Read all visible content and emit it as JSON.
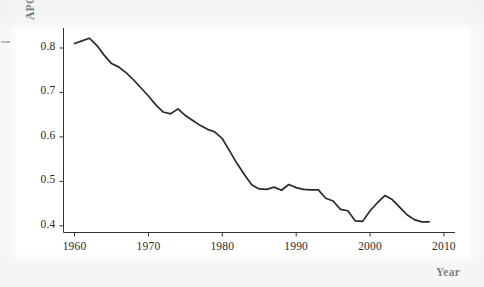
{
  "chart_data": {
    "type": "line",
    "title": "",
    "subtitle": "",
    "xlabel": "Year",
    "ylabel": "APC",
    "xlim": [
      1958.5,
      2011.5
    ],
    "ylim": [
      0.385,
      0.845
    ],
    "grid": false,
    "legend": null,
    "xticks": [
      1960,
      1970,
      1980,
      1990,
      2000,
      2010
    ],
    "xtick_labels": [
      "1960",
      "1970",
      "1980",
      "1990",
      "2000",
      "2010"
    ],
    "yticks": [
      0.4,
      0.5,
      0.6,
      0.7,
      0.8
    ],
    "ytick_labels": [
      "0.4",
      "0.5",
      "0.6",
      "0.7",
      "0.8"
    ],
    "series": [
      {
        "name": "APC",
        "color": "#2a2a2a",
        "x": [
          1960,
          1961,
          1962,
          1963,
          1964,
          1965,
          1966,
          1967,
          1968,
          1969,
          1970,
          1971,
          1972,
          1973,
          1974,
          1975,
          1976,
          1977,
          1978,
          1979,
          1980,
          1981,
          1982,
          1983,
          1984,
          1985,
          1986,
          1987,
          1988,
          1989,
          1990,
          1991,
          1992,
          1993,
          1994,
          1995,
          1996,
          1997,
          1998,
          1999,
          2000,
          2001,
          2002,
          2003,
          2004,
          2005,
          2006,
          2007,
          2008
        ],
        "values": [
          0.81,
          0.816,
          0.822,
          0.806,
          0.784,
          0.765,
          0.757,
          0.744,
          0.728,
          0.71,
          0.692,
          0.672,
          0.656,
          0.652,
          0.663,
          0.648,
          0.637,
          0.626,
          0.617,
          0.611,
          0.596,
          0.568,
          0.54,
          0.515,
          0.492,
          0.483,
          0.482,
          0.487,
          0.48,
          0.493,
          0.486,
          0.482,
          0.481,
          0.481,
          0.462,
          0.456,
          0.437,
          0.434,
          0.411,
          0.41,
          0.434,
          0.452,
          0.468,
          0.459,
          0.442,
          0.425,
          0.414,
          0.409,
          0.409
        ]
      }
    ]
  },
  "axis": {
    "y_title": "APC",
    "x_title": "Year"
  }
}
